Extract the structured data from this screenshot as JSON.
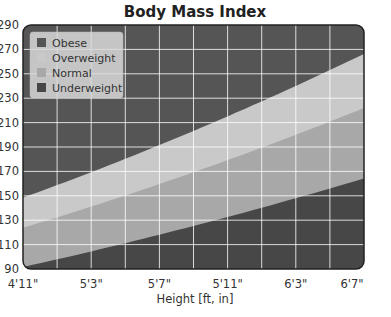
{
  "chart_data": {
    "type": "area",
    "title": "Body Mass Index",
    "xlabel": "Height  [ft, in]",
    "ylabel": "",
    "x_ticks": [
      "4'11\"",
      "5'3\"",
      "5'7\"",
      "5'11\"",
      "6'3\"",
      "6'7\""
    ],
    "x_tick_inches": [
      59,
      63,
      67,
      71,
      75,
      79
    ],
    "xlim_inches": [
      59,
      79
    ],
    "y_ticks": [
      290,
      270,
      250,
      230,
      210,
      190,
      170,
      150,
      130,
      110,
      90
    ],
    "y_tick_labels": [
      "290",
      "270",
      "250",
      "230",
      "210",
      "190",
      "170",
      "150",
      "130",
      "110",
      "90"
    ],
    "ylim": [
      90,
      290
    ],
    "grid": true,
    "legend_position": "upper left",
    "series": [
      {
        "name": "Obese",
        "bmi_min": 30,
        "color": "#555555"
      },
      {
        "name": "Overweight",
        "bmi_min": 25,
        "bmi_max": 30,
        "color": "#c9c9c9"
      },
      {
        "name": "Normal",
        "bmi_min": 18.5,
        "bmi_max": 25,
        "color": "#a8a8a8"
      },
      {
        "name": "Underweight",
        "bmi_max": 18.5,
        "color": "#474747"
      }
    ],
    "boundary_weights_lb": {
      "bmi_18_5": {
        "at_59in": 91.6,
        "at_79in": 164.2
      },
      "bmi_25": {
        "at_59in": 123.8,
        "at_79in": 221.9
      },
      "bmi_30": {
        "at_59in": 148.5,
        "at_79in": 266.3
      }
    }
  },
  "legend": {
    "items": [
      "Obese",
      "Overweight",
      "Normal",
      "Underweight"
    ]
  }
}
